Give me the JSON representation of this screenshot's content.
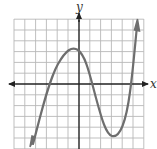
{
  "graph": {
    "x_label": "x",
    "y_label": "y",
    "grid": {
      "cols": 12,
      "rows": 12,
      "x_min": -6,
      "x_max": 6,
      "y_min": -6,
      "y_max": 6
    },
    "curve": {
      "type": "cubic",
      "description": "y = 0.2(x+3)(x-1)(x-5)",
      "roots": [
        -3,
        1,
        5
      ],
      "local_max": [
        -0.6,
        3.3
      ],
      "local_min": [
        3.3,
        -4.9
      ],
      "end_behavior": "down-left, up-right"
    },
    "colors": {
      "grid": "#b8b8b8",
      "axis": "#222222",
      "curve": "#6e6e6e"
    }
  }
}
